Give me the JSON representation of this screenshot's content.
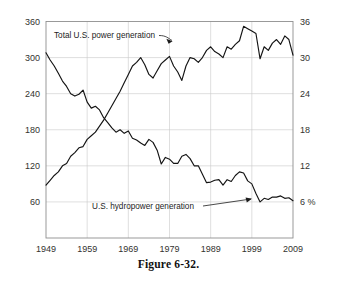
{
  "figure": {
    "caption": "Figure 6-32."
  },
  "chart_data": {
    "type": "line",
    "title": "",
    "subtitle": "",
    "xlabel": "",
    "ylabel": "",
    "grid": true,
    "legend_position": "inline-annotations",
    "x": [
      1949,
      1950,
      1951,
      1952,
      1953,
      1954,
      1955,
      1956,
      1957,
      1958,
      1959,
      1960,
      1961,
      1962,
      1963,
      1964,
      1965,
      1966,
      1967,
      1968,
      1969,
      1970,
      1971,
      1972,
      1973,
      1974,
      1975,
      1976,
      1977,
      1978,
      1979,
      1980,
      1981,
      1982,
      1983,
      1984,
      1985,
      1986,
      1987,
      1988,
      1989,
      1990,
      1991,
      1992,
      1993,
      1994,
      1995,
      1996,
      1997,
      1998,
      1999,
      2000,
      2001,
      2002,
      2003,
      2004,
      2005,
      2006,
      2007,
      2008,
      2009
    ],
    "x_axis": {
      "min": 1949,
      "max": 2009,
      "tick_labels": [
        "1949",
        "1959",
        "1969",
        "1979",
        "1989",
        "1999",
        "2009"
      ],
      "tick_values": [
        1949,
        1959,
        1969,
        1979,
        1989,
        1999,
        2009
      ]
    },
    "y_axis_left": {
      "min": 0,
      "max": 360,
      "tick_labels": [
        "60",
        "120",
        "180",
        "240",
        "300",
        "360"
      ],
      "tick_values": [
        60,
        120,
        180,
        240,
        300,
        360
      ],
      "unit": ""
    },
    "y_axis_right": {
      "min": 0,
      "max": 36,
      "tick_labels": [
        "6 %",
        "12",
        "18",
        "24",
        "30",
        "36"
      ],
      "tick_values": [
        6,
        12,
        18,
        24,
        30,
        36
      ],
      "unit": "%"
    },
    "series": [
      {
        "name": "Total U.S. power generation",
        "axis": "left",
        "annotation": "Total U.S. power generation",
        "values": [
          88,
          96,
          104,
          110,
          120,
          124,
          136,
          142,
          150,
          152,
          164,
          170,
          176,
          186,
          196,
          208,
          220,
          232,
          244,
          258,
          272,
          286,
          292,
          300,
          288,
          272,
          266,
          278,
          290,
          296,
          302,
          286,
          276,
          262,
          286,
          300,
          298,
          292,
          300,
          312,
          318,
          310,
          306,
          300,
          318,
          314,
          322,
          328,
          352,
          348,
          344,
          340,
          298,
          318,
          312,
          324,
          330,
          322,
          336,
          330,
          304
        ],
        "estimated": true
      },
      {
        "name": "U.S. hydropower generation",
        "axis": "right",
        "annotation": "U.S. hydropower generation",
        "values": [
          30.8,
          29.6,
          28.6,
          27.4,
          26.1,
          25.2,
          24.0,
          23.6,
          23.9,
          24.6,
          22.6,
          21.6,
          21.9,
          21.3,
          20.0,
          19.2,
          18.3,
          17.6,
          18.0,
          17.4,
          17.8,
          16.6,
          16.3,
          15.8,
          15.4,
          16.4,
          15.9,
          14.6,
          12.3,
          13.4,
          13.1,
          12.4,
          12.4,
          13.6,
          13.9,
          13.2,
          12.0,
          12.0,
          10.6,
          9.2,
          9.3,
          9.6,
          9.7,
          8.8,
          9.7,
          9.4,
          10.4,
          11.0,
          10.8,
          9.5,
          9.0,
          7.4,
          6.0,
          6.6,
          6.4,
          6.8,
          6.8,
          7.0,
          6.6,
          6.7,
          6.2
        ],
        "estimated": true
      }
    ]
  }
}
